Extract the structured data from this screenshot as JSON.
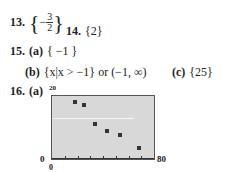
{
  "answers": {
    "q13": {
      "number": "13.",
      "open": "{",
      "sign": "−",
      "numerator": "3",
      "denominator": "2",
      "close": "}"
    },
    "q14": {
      "number": "14.",
      "value": "{2}"
    },
    "q15": {
      "number": "15.",
      "a": {
        "label": "(a)",
        "value": "{ −1 }"
      },
      "b": {
        "label": "(b)",
        "value": "{x|x > −1} or (−1, ∞)"
      },
      "c": {
        "label": "(c)",
        "value": "{25}"
      }
    },
    "q16": {
      "number": "16.",
      "a": {
        "label": "(a)"
      }
    }
  },
  "chart_data": {
    "type": "scatter",
    "title": "",
    "xlabel": "",
    "ylabel": "",
    "xlim": [
      0,
      80
    ],
    "ylim": [
      0,
      20
    ],
    "tick_labels": {
      "x_min": "0",
      "x_max": "80",
      "y_min": "0",
      "y_max": "20"
    },
    "x_ticks": [
      10,
      20,
      30,
      40,
      50,
      60,
      70
    ],
    "grid": false,
    "points": [
      {
        "x": 18,
        "y": 18
      },
      {
        "x": 25,
        "y": 17
      },
      {
        "x": 34,
        "y": 11
      },
      {
        "x": 43,
        "y": 9
      },
      {
        "x": 53,
        "y": 7.5
      },
      {
        "x": 68,
        "y": 3.5
      }
    ]
  }
}
